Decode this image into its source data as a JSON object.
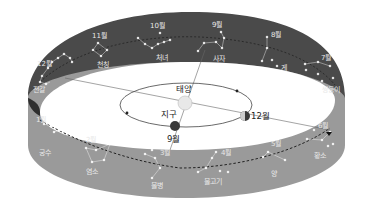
{
  "diagram": {
    "colors": {
      "upper_band": "#4a4a4a",
      "lower_band": "#9a9a9a",
      "lower_band_edge": "#b8b8b8",
      "inner_shadow": "#2e2e2e",
      "sun": "#e8e8e8",
      "earth": "#3a3a3a",
      "star": "#ffffff",
      "ecliptic": "#222222"
    },
    "center": {
      "sun_label": "태양",
      "earth_label": "지구",
      "earth_month_label": "9월",
      "earth2_month_label": "12월"
    },
    "constellations": [
      {
        "month": "1월",
        "name": "궁수"
      },
      {
        "month": "2월",
        "name": "염소"
      },
      {
        "month": "3월",
        "name": "물병"
      },
      {
        "month": "4월",
        "name": "물고기"
      },
      {
        "month": "5월",
        "name": "양"
      },
      {
        "month": "6월",
        "name": "황소"
      },
      {
        "month": "7월",
        "name": "쌍둥이"
      },
      {
        "month": "8월",
        "name": "게"
      },
      {
        "month": "9월",
        "name": "사자"
      },
      {
        "month": "10월",
        "name": "처녀"
      },
      {
        "month": "11월",
        "name": "천칭"
      },
      {
        "month": "12월",
        "name": "전갈"
      }
    ]
  }
}
